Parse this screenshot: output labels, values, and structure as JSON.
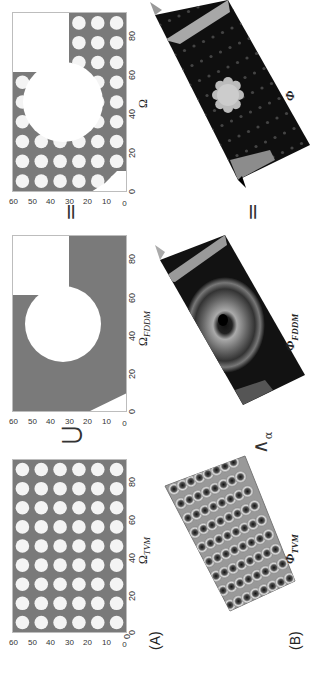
{
  "figure": {
    "panel_a_label": "(A)",
    "panel_b_label": "(B)",
    "operators_top": [
      "⋃",
      "="
    ],
    "operators_bottom": [
      "⋀α",
      "="
    ],
    "lambda_sub": "α",
    "colors": {
      "domain_fill": "#7a7a7a",
      "hole_fill": "#ffffff",
      "surface_dark": "#111111"
    }
  },
  "chart_data": [
    {
      "type": "heatmap",
      "title": "",
      "xlabel": "Ω",
      "xlabel_sub": "TVM",
      "ylabel": "",
      "x_ticks": [
        "0",
        "20",
        "40",
        "60",
        "80"
      ],
      "y_ticks": [
        "0",
        "10",
        "20",
        "30",
        "40",
        "50",
        "60"
      ],
      "xlim": [
        0,
        90
      ],
      "ylim": [
        0,
        60
      ],
      "description": "Grey domain with 9x6 grid of circular white holes"
    },
    {
      "type": "heatmap",
      "title": "",
      "xlabel": "Ω",
      "xlabel_sub": "FDDM",
      "x_ticks": [
        "0",
        "20",
        "40",
        "60",
        "80"
      ],
      "y_ticks": [
        "0",
        "10",
        "20",
        "30",
        "40",
        "50",
        "60"
      ],
      "xlim": [
        0,
        90
      ],
      "ylim": [
        0,
        60
      ],
      "description": "Grey domain with large central circular hole, rectangular cutout top-right, and corner chamfer bottom-left"
    },
    {
      "type": "heatmap",
      "title": "",
      "xlabel": "Ω",
      "xlabel_sub": "",
      "x_ticks": [
        "0",
        "20",
        "40",
        "60",
        "80"
      ],
      "y_ticks": [
        "0",
        "10",
        "20",
        "30",
        "40",
        "50",
        "60"
      ],
      "xlim": [
        0,
        90
      ],
      "ylim": [
        0,
        60
      ],
      "description": "Union: holes grid plus large circle, rectangular cutout, corner chamfer"
    }
  ],
  "surfaces": [
    {
      "label": "Φ",
      "sub": "TVM"
    },
    {
      "label": "Φ",
      "sub": "FDDM"
    },
    {
      "label": "Φ",
      "sub": ""
    }
  ]
}
